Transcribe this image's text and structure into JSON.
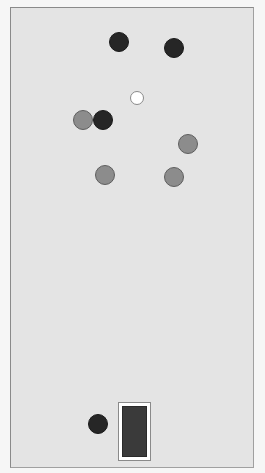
{
  "colors": {
    "background": "#f6f6f6",
    "field": "#e4e4e4",
    "field_border": "#8a8a8a",
    "dark_ball": "#262626",
    "gray_ball": "#8c8c8c",
    "white_ball": "#ffffff",
    "paddle_fill": "#3a3a3a"
  },
  "field": {
    "x": 10,
    "y": 7,
    "width": 244,
    "height": 461
  },
  "balls": [
    {
      "id": "dark-1",
      "type": "dark",
      "cx": 119,
      "cy": 42,
      "r": 10
    },
    {
      "id": "dark-2",
      "type": "dark",
      "cx": 174,
      "cy": 48,
      "r": 10
    },
    {
      "id": "white-1",
      "type": "white",
      "cx": 137,
      "cy": 98,
      "r": 7
    },
    {
      "id": "gray-1",
      "type": "gray",
      "cx": 83,
      "cy": 120,
      "r": 10
    },
    {
      "id": "dark-3",
      "type": "dark",
      "cx": 103,
      "cy": 120,
      "r": 10
    },
    {
      "id": "gray-2",
      "type": "gray",
      "cx": 188,
      "cy": 144,
      "r": 10
    },
    {
      "id": "gray-3",
      "type": "gray",
      "cx": 105,
      "cy": 175,
      "r": 10
    },
    {
      "id": "gray-4",
      "type": "gray",
      "cx": 174,
      "cy": 177,
      "r": 10
    },
    {
      "id": "dark-4",
      "type": "dark",
      "cx": 98,
      "cy": 424,
      "r": 10
    }
  ],
  "paddle": {
    "x": 118,
    "y": 402,
    "width": 33,
    "height": 59
  }
}
